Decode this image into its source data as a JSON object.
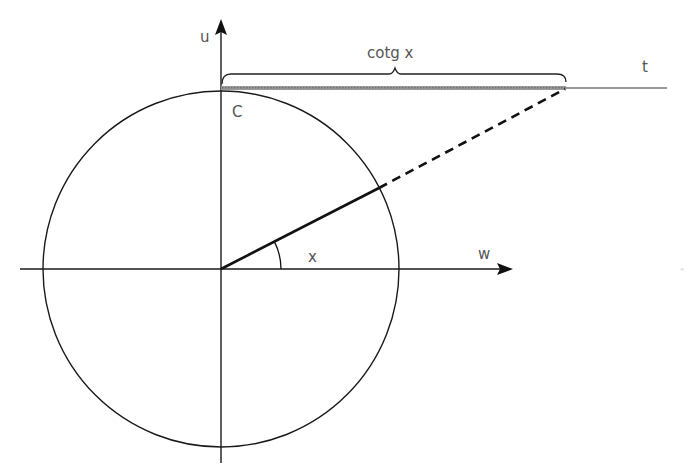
{
  "diagram": {
    "labels": {
      "vertical_axis": "u",
      "horizontal_axis": "w",
      "tangent_line": "t",
      "point_c": "C",
      "angle": "x",
      "brace": "cotg x"
    },
    "angle_degrees": 27,
    "colors": {
      "line": "#1a1a1a",
      "text": "#555555",
      "segment_highlight": "#8a8a8a"
    }
  }
}
